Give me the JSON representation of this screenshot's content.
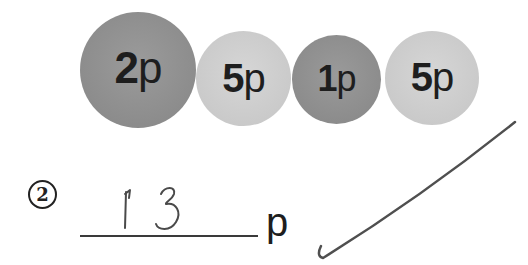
{
  "coins": [
    {
      "value": "2",
      "unit": "p",
      "shade": "dark",
      "color": "#8e8e8e"
    },
    {
      "value": "5",
      "unit": "p",
      "shade": "light",
      "color": "#cbcbcb"
    },
    {
      "value": "1",
      "unit": "p",
      "shade": "dark",
      "color": "#8e8e8e"
    },
    {
      "value": "5",
      "unit": "p",
      "shade": "light",
      "color": "#cbcbcb"
    }
  ],
  "question": {
    "number": "2",
    "answer_handwritten": "13",
    "unit": "p"
  },
  "marking": {
    "result": "correct",
    "icon": "check-mark-icon"
  }
}
